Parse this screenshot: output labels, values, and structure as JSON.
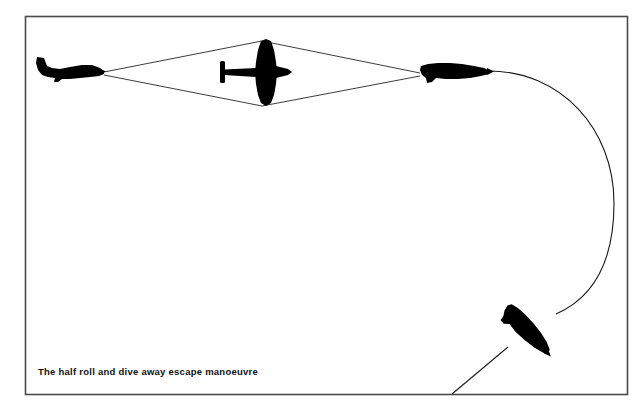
{
  "figure": {
    "caption": "The half roll and dive away escape manoeuvre",
    "border": {
      "color": "#4a4a4a",
      "x": 25,
      "y": 16,
      "width": 603,
      "height": 379,
      "stroke_width": 1.6
    },
    "colors": {
      "aircraft_fill": "#000000",
      "path_line": "#222222",
      "background": "#ffffff",
      "caption_text": "#111111"
    },
    "aircraft": [
      {
        "name": "aircraft-left-level",
        "label": "left side-view fighter, level flight, heading right",
        "view": "side",
        "x": 37,
        "y": 57,
        "width": 68,
        "height": 26,
        "rotation_deg": 0
      },
      {
        "name": "aircraft-center-rolling",
        "label": "centre plan-view fighter, half roll, wings vertical",
        "view": "plan",
        "x": 247,
        "y": 39,
        "width": 48,
        "height": 67,
        "rotation_deg": 0
      },
      {
        "name": "aircraft-right-inverted",
        "label": "right side-view fighter, inverted after half roll",
        "view": "side-inverted",
        "x": 421,
        "y": 62,
        "width": 70,
        "height": 22,
        "rotation_deg": 0
      },
      {
        "name": "aircraft-bottom-diving",
        "label": "lower right fighter, diving away down-left",
        "view": "side-inverted",
        "x": 497,
        "y": 307,
        "width": 62,
        "height": 52,
        "rotation_deg": 47
      }
    ],
    "paths": [
      {
        "name": "sight-line-upper",
        "type": "straight",
        "from": [
          104,
          72
        ],
        "to": [
          420,
          73
        ],
        "via": [
          262,
          41
        ]
      },
      {
        "name": "sight-line-lower",
        "type": "straight",
        "from": [
          104,
          75
        ],
        "to": [
          420,
          76
        ],
        "via": [
          262,
          106
        ]
      },
      {
        "name": "escape-arc",
        "type": "arc",
        "from": [
          489,
          72
        ],
        "to": [
          556,
          312
        ],
        "apex_x": 614,
        "apex_y": 200
      },
      {
        "name": "dive-exit-line",
        "type": "straight",
        "from": [
          505,
          349
        ],
        "to": [
          452,
          394
        ]
      }
    ]
  }
}
